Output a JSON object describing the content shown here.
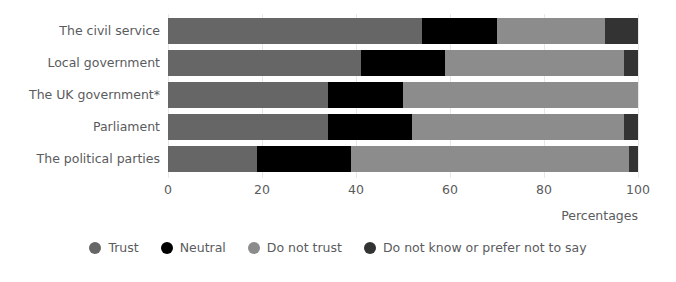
{
  "chart_data": {
    "type": "bar",
    "orientation": "horizontal",
    "stacked": true,
    "stack_mode": "percent",
    "title": "",
    "subtitle": "",
    "xlabel": "Percentages",
    "ylabel": "",
    "xlim": [
      0,
      100
    ],
    "xticks": [
      0,
      20,
      40,
      60,
      80,
      100
    ],
    "xtick_labels": [
      "0",
      "20",
      "40",
      "60",
      "80",
      "100"
    ],
    "grid": true,
    "legend_position": "bottom",
    "categories": [
      "The civil service",
      "Local government",
      "The UK government*",
      "Parliament",
      "The political parties"
    ],
    "series": [
      {
        "name": "Trust",
        "color": "#666666",
        "values": [
          54,
          41,
          34,
          34,
          19
        ]
      },
      {
        "name": "Neutral",
        "color": "#000000",
        "values": [
          16,
          18,
          16,
          18,
          20
        ]
      },
      {
        "name": "Do not trust",
        "color": "#8c8c8c",
        "values": [
          23,
          38,
          50,
          45,
          59
        ]
      },
      {
        "name": "Do not know or prefer not to say",
        "color": "#333333",
        "values": [
          7,
          3,
          0,
          3,
          2
        ]
      }
    ]
  },
  "legend": {
    "items": [
      {
        "label": "Trust",
        "color": "#666666"
      },
      {
        "label": "Neutral",
        "color": "#000000"
      },
      {
        "label": "Do not trust",
        "color": "#8c8c8c"
      },
      {
        "label": "Do not know or prefer not to say",
        "color": "#333333"
      }
    ]
  },
  "axis": {
    "x_title": "Percentages"
  }
}
